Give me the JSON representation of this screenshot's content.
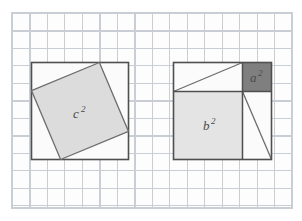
{
  "figure": {
    "background": {
      "name": "graph-paper",
      "grid_color": "#c9cdd4",
      "paper_color": "#fdfdfd",
      "cell_size_px": 17.5,
      "frame": {
        "x": 12,
        "y": 13,
        "width": 280,
        "height": 195
      }
    },
    "colors": {
      "outline": "#4f4f4f",
      "c_square_fill": "#dcdcdc",
      "b_square_fill": "#e4e4e4",
      "a_square_fill": "#7f7f7f",
      "triangle_fill": "#fbfbfb",
      "label_color": "#4a4a4a"
    },
    "panels": [
      {
        "id": "left-panel",
        "name": "c-square-panel",
        "outer_square": {
          "x": 31,
          "y": 62,
          "width": 97,
          "height": 97
        },
        "shapes": [
          {
            "name": "outer-square-left",
            "type": "square",
            "fill": "#fbfbfb"
          },
          {
            "name": "tilted-square-c",
            "type": "rotated-square",
            "fill": "#dcdcdc",
            "vertices_pct": [
              {
                "x": 0.7,
                "y": 0.0
              },
              {
                "x": 1.0,
                "y": 0.71
              },
              {
                "x": 0.3,
                "y": 1.0
              },
              {
                "x": 0.0,
                "y": 0.29
              }
            ]
          }
        ],
        "labels": [
          {
            "name": "label-c-squared",
            "base": "c",
            "exponent": "2",
            "x_pct": 0.47,
            "y_pct": 0.5
          }
        ]
      },
      {
        "id": "right-panel",
        "name": "ab-squares-panel",
        "outer_square": {
          "x": 173,
          "y": 62,
          "width": 99,
          "height": 98
        },
        "divider_h_pct": 0.295,
        "divider_v_pct": 0.705,
        "shapes": [
          {
            "name": "square-b",
            "type": "square",
            "fill": "#e4e4e4",
            "rect_pct": {
              "x": 0.0,
              "y": 0.295,
              "w": 0.705,
              "h": 0.705
            }
          },
          {
            "name": "square-a",
            "type": "square",
            "fill": "#7f7f7f",
            "rect_pct": {
              "x": 0.705,
              "y": 0.0,
              "w": 0.295,
              "h": 0.295
            }
          },
          {
            "name": "triangle-top",
            "type": "right-triangle",
            "fill": "#fbfbfb",
            "vertices_pct": [
              {
                "x": 0.0,
                "y": 0.0
              },
              {
                "x": 0.705,
                "y": 0.0
              },
              {
                "x": 0.0,
                "y": 0.295
              }
            ]
          },
          {
            "name": "triangle-right",
            "type": "right-triangle",
            "fill": "#fbfbfb",
            "vertices_pct": [
              {
                "x": 0.705,
                "y": 0.295
              },
              {
                "x": 1.0,
                "y": 1.0
              },
              {
                "x": 0.705,
                "y": 1.0
              }
            ]
          }
        ],
        "labels": [
          {
            "name": "label-b-squared",
            "base": "b",
            "exponent": "2",
            "x_pct": 0.35,
            "y_pct": 0.66
          },
          {
            "name": "label-a-squared",
            "base": "a",
            "exponent": "2",
            "x_pct": 0.85,
            "y_pct": 0.155
          }
        ]
      }
    ]
  }
}
